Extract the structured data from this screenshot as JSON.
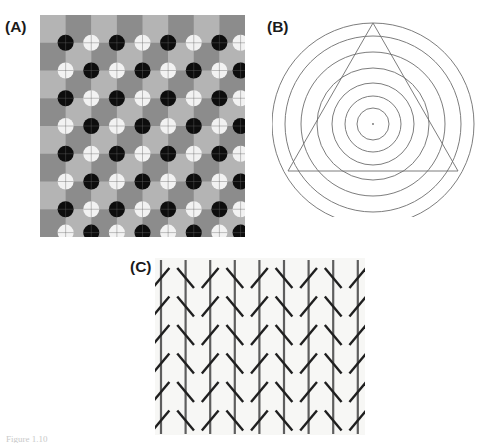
{
  "figure": {
    "width": 490,
    "height": 447,
    "background_color": "#ffffff",
    "caption_stub_text": "Figure 1.10"
  },
  "panels": [
    {
      "id": "A",
      "label": "(A)",
      "name": "scintillating-grid-illusion",
      "illusion_name": "Scintillating grid / Hermann grid variant",
      "x": 40,
      "y": 15,
      "width": 205,
      "height": 222,
      "grid": {
        "columns": 8,
        "rows": 8,
        "cell_width": 25.6,
        "cell_height": 27.75,
        "light_gray": "#b4b4b4",
        "dark_gray": "#8c8c8c",
        "checker_start": "light"
      },
      "dots": {
        "radius": 8.0,
        "black_color": "#0d0d0d",
        "white_color": "#f2f2f2",
        "crosshair_color": "#5a5a5a",
        "crosshair_width": 0.8,
        "intersections_x": 8,
        "intersections_y": 8,
        "pattern": "checkerboard alternation of black and white dots at grid intersections",
        "first_dot_color": "black"
      }
    },
    {
      "id": "B",
      "label": "(B)",
      "name": "orbison-illusion",
      "illusion_name": "Orbison illusion (triangle on concentric circles)",
      "x": 272,
      "y": 12,
      "width": 205,
      "height": 205,
      "circles": {
        "center_x": 101,
        "center_y": 112,
        "count": 7,
        "radii": [
          16,
          28,
          41,
          56,
          72,
          88,
          101
        ],
        "stroke_color": "#6e6e6e",
        "stroke_width": 0.9
      },
      "center_dot": {
        "radius": 0.9,
        "color": "#6e6e6e"
      },
      "triangle": {
        "apex_x": 101,
        "apex_y": 11,
        "base_left_x": 16,
        "base_right_x": 186,
        "base_y": 159,
        "stroke_color": "#6e6e6e",
        "stroke_width": 0.9
      }
    },
    {
      "id": "C",
      "label": "(C)",
      "name": "zollner-illusion",
      "illusion_name": "Zollner illusion (oblique hatches on parallel verticals)",
      "x": 155,
      "y": 258,
      "width": 210,
      "height": 177,
      "background_color": "#f7f7f5",
      "vertical_lines": {
        "count": 9,
        "spacing": 24.6,
        "first_x": 6,
        "top_y": 2,
        "bottom_y": 176,
        "stroke_color": "#5e5e5e",
        "stroke_width": 2.2
      },
      "hatches": {
        "rows": 6,
        "row_spacing": 28.5,
        "first_row_y": 20,
        "length": 26,
        "angle_degrees": 50,
        "stroke_color": "#1f1f1f",
        "stroke_width": 2.4,
        "alternation": "tilt direction alternates between adjacent vertical lines"
      }
    }
  ]
}
